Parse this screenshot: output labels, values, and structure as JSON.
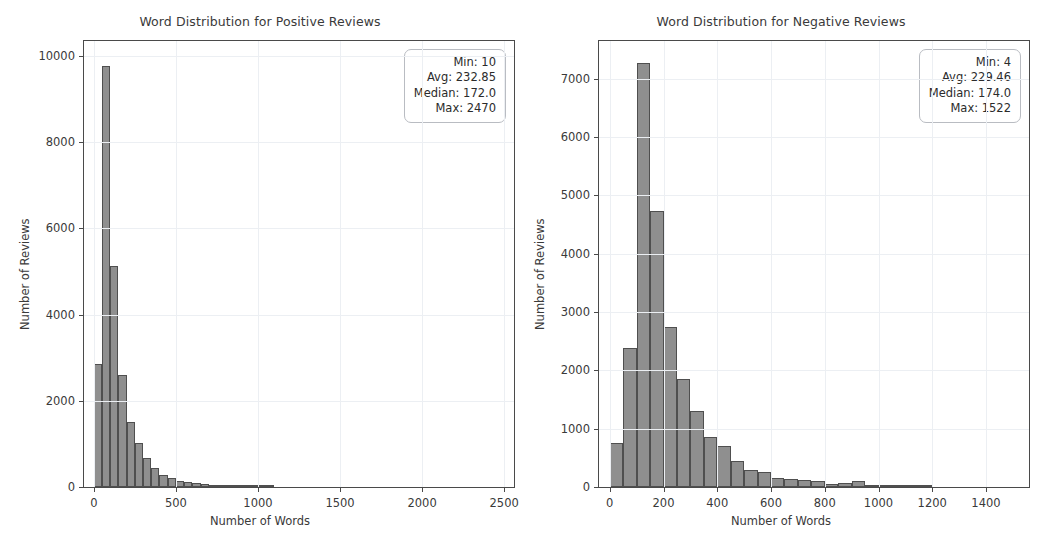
{
  "figure": {
    "background": "#ffffff",
    "bar_color": "#8f8f8f",
    "bar_edge_color": "#4f4f4f",
    "grid_color": "#eceff3",
    "axis_color": "#4a4a4a"
  },
  "panels": [
    {
      "id": "positive",
      "title": "Word Distribution for Positive Reviews",
      "xlabel": "Number of Words",
      "ylabel": "Number of Reviews",
      "xticks": [
        "0",
        "500",
        "1000",
        "1500",
        "2000",
        "2500"
      ],
      "yticks": [
        "0",
        "2000",
        "4000",
        "6000",
        "8000",
        "10000"
      ],
      "stats": {
        "min": "Min: 10",
        "avg": "Avg: 232.85",
        "median": "Median: 172.0",
        "max": "Max: 2470"
      }
    },
    {
      "id": "negative",
      "title": "Word Distribution for Negative Reviews",
      "xlabel": "Number of Words",
      "ylabel": "Number of Reviews",
      "xticks": [
        "0",
        "200",
        "400",
        "600",
        "800",
        "1000",
        "1200",
        "1400"
      ],
      "yticks": [
        "0",
        "1000",
        "2000",
        "3000",
        "4000",
        "5000",
        "6000",
        "7000"
      ],
      "stats": {
        "min": "Min: 4",
        "avg": "Avg: 229.46",
        "median": "Median: 174.0",
        "max": "Max: 1522"
      }
    }
  ],
  "chart_data": [
    {
      "type": "bar",
      "subtype": "histogram",
      "title": "Word Distribution for Positive Reviews",
      "xlabel": "Number of Words",
      "ylabel": "Number of Reviews",
      "xlim": [
        -60,
        2560
      ],
      "ylim": [
        0,
        10350
      ],
      "xticks": [
        0,
        500,
        1000,
        1500,
        2000,
        2500
      ],
      "yticks": [
        0,
        2000,
        4000,
        6000,
        8000,
        10000
      ],
      "grid": true,
      "legend": null,
      "bin_width": 50,
      "bin_edges": [
        0,
        50,
        100,
        150,
        200,
        250,
        300,
        350,
        400,
        450,
        500,
        550,
        600,
        650,
        700,
        750,
        800,
        850,
        900,
        950,
        1000,
        1050,
        1100
      ],
      "bin_centers": [
        25,
        75,
        125,
        175,
        225,
        275,
        325,
        375,
        425,
        475,
        525,
        575,
        625,
        675,
        725,
        775,
        825,
        875,
        925,
        975,
        1025,
        1075
      ],
      "values": [
        2850,
        9780,
        5120,
        2600,
        1500,
        1030,
        680,
        450,
        290,
        200,
        150,
        120,
        90,
        60,
        40,
        30,
        20,
        15,
        10,
        8,
        5,
        3
      ],
      "annotations": {
        "stats_box": [
          "Min: 10",
          "Avg: 232.85",
          "Median: 172.0",
          "Max: 2470"
        ]
      },
      "summary_stats": {
        "min": 10,
        "avg": 232.85,
        "median": 172.0,
        "max": 2470
      }
    },
    {
      "type": "bar",
      "subtype": "histogram",
      "title": "Word Distribution for Negative Reviews",
      "xlabel": "Number of Words",
      "ylabel": "Number of Reviews",
      "xlim": [
        -40,
        1560
      ],
      "ylim": [
        0,
        7650
      ],
      "xticks": [
        0,
        200,
        400,
        600,
        800,
        1000,
        1200,
        1400
      ],
      "yticks": [
        0,
        1000,
        2000,
        3000,
        4000,
        5000,
        6000,
        7000
      ],
      "grid": true,
      "legend": null,
      "bin_width": 50,
      "bin_edges": [
        0,
        50,
        100,
        150,
        200,
        250,
        300,
        350,
        400,
        450,
        500,
        550,
        600,
        650,
        700,
        750,
        800,
        850,
        900,
        950,
        1000,
        1050,
        1100,
        1150,
        1200
      ],
      "bin_centers": [
        25,
        75,
        125,
        175,
        225,
        275,
        325,
        375,
        425,
        475,
        525,
        575,
        625,
        675,
        725,
        775,
        825,
        875,
        925,
        975,
        1025,
        1075,
        1125,
        1175
      ],
      "values": [
        760,
        2390,
        7280,
        4730,
        2750,
        1860,
        1300,
        860,
        700,
        440,
        300,
        250,
        150,
        130,
        120,
        110,
        60,
        70,
        100,
        20,
        10,
        8,
        5,
        3
      ],
      "annotations": {
        "stats_box": [
          "Min: 4",
          "Avg: 229.46",
          "Median: 174.0",
          "Max: 1522"
        ]
      },
      "summary_stats": {
        "min": 4,
        "avg": 229.46,
        "median": 174.0,
        "max": 1522
      }
    }
  ]
}
